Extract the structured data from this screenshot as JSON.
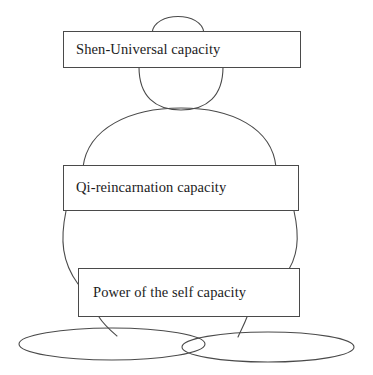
{
  "diagram": {
    "type": "layered-figure-diagram",
    "title": "",
    "background_color": "#ffffff",
    "stroke_color": "#4a4a4a",
    "text_color": "#1c1c1c",
    "boxes": [
      {
        "id": "shen",
        "label": "Shen-Universal capacity",
        "level": "top"
      },
      {
        "id": "qi",
        "label": "Qi-reincarnation capacity",
        "level": "middle"
      },
      {
        "id": "power",
        "label": "Power of the self capacity",
        "level": "bottom"
      }
    ],
    "figure_parts": [
      {
        "name": "head-crown-arc"
      },
      {
        "name": "head-oval"
      },
      {
        "name": "torso-shoulder-arc"
      },
      {
        "name": "left-body-curve"
      },
      {
        "name": "right-body-curve"
      },
      {
        "name": "left-leg"
      },
      {
        "name": "right-leg"
      },
      {
        "name": "left-foot-ellipse"
      },
      {
        "name": "right-foot-ellipse"
      }
    ]
  }
}
